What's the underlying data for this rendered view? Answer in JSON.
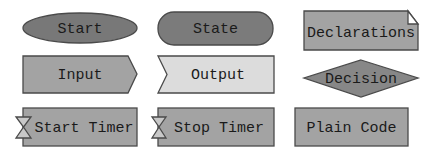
{
  "palette": {
    "dark_fill": "#787878",
    "mid_fill": "#a3a3a3",
    "light_fill": "#dcdcdc",
    "white": "#ffffff",
    "stroke": "#4a4a4a",
    "text": "#1a1a1a"
  },
  "shapes": [
    {
      "id": "start",
      "label": "Start",
      "type": "ellipse"
    },
    {
      "id": "state",
      "label": "State",
      "type": "rounded-rect"
    },
    {
      "id": "declarations",
      "label": "Declarations",
      "type": "folded-rect"
    },
    {
      "id": "input",
      "label": "Input",
      "type": "arrow-right"
    },
    {
      "id": "output",
      "label": "Output",
      "type": "notched-left"
    },
    {
      "id": "decision",
      "label": "Decision",
      "type": "diamond"
    },
    {
      "id": "start-timer",
      "label": "Start Timer",
      "type": "timer-rect"
    },
    {
      "id": "stop-timer",
      "label": "Stop Timer",
      "type": "timer-rect"
    },
    {
      "id": "plain-code",
      "label": "Plain Code",
      "type": "rect"
    }
  ]
}
